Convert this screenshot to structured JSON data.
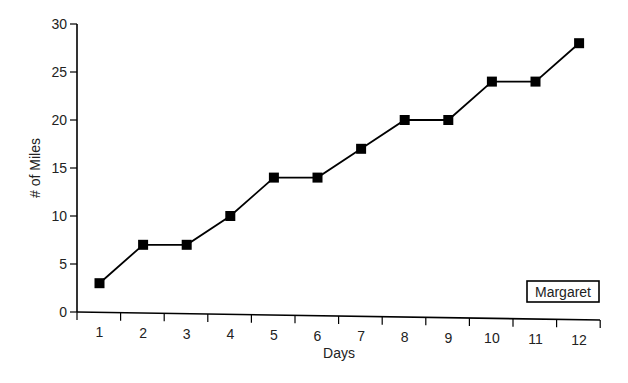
{
  "chart_data": {
    "type": "line",
    "title": "",
    "xlabel": "Days",
    "ylabel": "# of Miles",
    "x": [
      1,
      2,
      3,
      4,
      5,
      6,
      7,
      8,
      9,
      10,
      11,
      12
    ],
    "x_tick_labels": [
      "1",
      "2",
      "3",
      "4",
      "5",
      "6",
      "7",
      "8",
      "9",
      "10",
      "11",
      "12"
    ],
    "y_tick_labels": [
      "0",
      "5",
      "10",
      "15",
      "20",
      "25",
      "30"
    ],
    "y_ticks": [
      0,
      5,
      10,
      15,
      20,
      25,
      30
    ],
    "ylim": [
      0,
      30
    ],
    "xlim": [
      0.5,
      12.5
    ],
    "grid": false,
    "series": [
      {
        "name": "Margaret",
        "values": [
          3,
          7,
          7,
          10,
          14,
          14,
          17,
          20,
          20,
          24,
          24,
          28
        ],
        "marker": "square",
        "color": "#000000"
      }
    ],
    "legend": {
      "position": "bottom-right",
      "entries": [
        "Margaret"
      ]
    }
  }
}
